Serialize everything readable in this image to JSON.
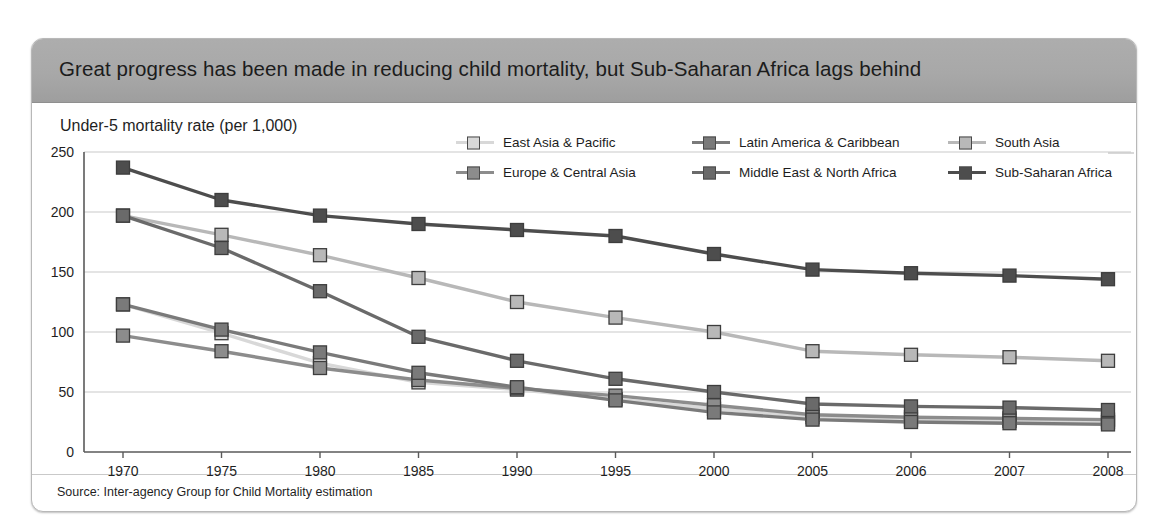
{
  "card": {
    "title": "Great progress has been made in reducing child mortality, but Sub-Saharan Africa lags behind",
    "axis_title": "Under-5 mortality rate (per 1,000)",
    "source": "Source: Inter-agency Group for Child Mortality estimation"
  },
  "colors": {
    "title_bar": "#a8a8a8",
    "card_bg": "#ffffff",
    "east_asia_pacific": "#d8d8d8",
    "europe_central_asia": "#8c8c8c",
    "latin_america_caribbean": "#7a7a7a",
    "middle_east_north_africa": "#6a6a6a",
    "south_asia": "#b8b8b8",
    "sub_saharan_africa": "#4d4d4d",
    "gridline": "#c9c9c9",
    "axis": "#555555"
  },
  "legend": {
    "items": [
      {
        "label": "East Asia & Pacific",
        "key": "east_asia_pacific",
        "color": "#d8d8d8",
        "col": 0,
        "row": 0
      },
      {
        "label": "Europe & Central Asia",
        "key": "europe_central_asia",
        "color": "#8c8c8c",
        "col": 0,
        "row": 1
      },
      {
        "label": "Latin America & Caribbean",
        "key": "latin_america_caribbean",
        "color": "#7a7a7a",
        "col": 1,
        "row": 0
      },
      {
        "label": "Middle East & North Africa",
        "key": "middle_east_north_africa",
        "color": "#6a6a6a",
        "col": 1,
        "row": 1
      },
      {
        "label": "South Asia",
        "key": "south_asia",
        "color": "#b8b8b8",
        "col": 2,
        "row": 0
      },
      {
        "label": "Sub-Saharan Africa",
        "key": "sub_saharan_africa",
        "color": "#4d4d4d",
        "col": 2,
        "row": 1
      }
    ]
  },
  "chart_data": {
    "type": "line",
    "title": "Great progress has been made in reducing child mortality, but Sub-Saharan Africa lags behind",
    "subtitle": "Under-5 mortality rate (per 1,000)",
    "xlabel": "",
    "ylabel": "Under-5 mortality rate (per 1,000)",
    "ylim": [
      0,
      250
    ],
    "yticks": [
      0,
      50,
      100,
      150,
      200,
      250
    ],
    "grid": true,
    "legend_position": "top-right",
    "categories": [
      "1970",
      "1975",
      "1980",
      "1985",
      "1990",
      "1995",
      "2000",
      "2005",
      "2006",
      "2007",
      "2008"
    ],
    "series": [
      {
        "name": "East Asia & Pacific",
        "color": "#d8d8d8",
        "values": [
          123,
          99,
          74,
          58,
          52,
          44,
          36,
          29,
          27,
          26,
          25
        ]
      },
      {
        "name": "Europe & Central Asia",
        "color": "#8c8c8c",
        "values": [
          97,
          84,
          70,
          60,
          53,
          47,
          39,
          31,
          29,
          28,
          27
        ]
      },
      {
        "name": "Latin America & Caribbean",
        "color": "#7a7a7a",
        "values": [
          123,
          102,
          83,
          66,
          54,
          43,
          33,
          27,
          25,
          24,
          23
        ]
      },
      {
        "name": "Middle East & North Africa",
        "color": "#6a6a6a",
        "values": [
          197,
          170,
          134,
          96,
          76,
          61,
          50,
          40,
          38,
          37,
          35
        ]
      },
      {
        "name": "South Asia",
        "color": "#b8b8b8",
        "values": [
          197,
          181,
          164,
          145,
          125,
          112,
          100,
          84,
          81,
          79,
          76
        ]
      },
      {
        "name": "Sub-Saharan Africa",
        "color": "#4d4d4d",
        "values": [
          237,
          210,
          197,
          190,
          185,
          180,
          165,
          152,
          149,
          147,
          144
        ]
      }
    ]
  }
}
